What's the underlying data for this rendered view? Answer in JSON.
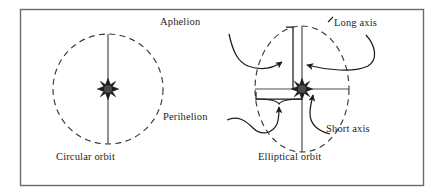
{
  "figure": {
    "kind": "diagram",
    "title_visible": false,
    "frame": {
      "name": "figure-border",
      "x": 20,
      "y": 9,
      "width": 404,
      "height": 177,
      "stroke": "#6b6b6b",
      "fill": "#ffffff"
    },
    "colors": {
      "ink": "#1d1d1d",
      "orbit_stroke": "#3a3a3a",
      "frame_stroke": "#6b6b6b",
      "axis_stroke": "#4a4a4a",
      "background": "#ffffff"
    }
  },
  "panels": [
    {
      "id": "circular",
      "caption": "Circular orbit",
      "caption_pos": {
        "x": 56,
        "y": 157
      },
      "orbit": {
        "type": "circle",
        "style": "dashed",
        "cx": 108,
        "cy": 89,
        "r": 55
      },
      "star": {
        "name": "sun-star",
        "cx": 108,
        "cy": 89,
        "r": 9
      },
      "axis": {
        "name": "vertical-diameter",
        "x1": 108,
        "y1": 34,
        "x2": 108,
        "y2": 144
      },
      "labels": [
        {
          "id": "aphelion",
          "text": "Aphelion",
          "x": 160,
          "y": 22
        },
        {
          "id": "perihelion",
          "text": "Perihelion",
          "x": 163,
          "y": 117
        }
      ]
    },
    {
      "id": "elliptical",
      "caption": "Elliptical orbit",
      "caption_pos": {
        "x": 258,
        "y": 157
      },
      "orbit": {
        "type": "ellipse",
        "style": "dashed",
        "cx": 302,
        "cy": 89,
        "rx": 47,
        "ry": 63
      },
      "star": {
        "name": "sun-star",
        "cx": 302,
        "cy": 89,
        "r": 9
      },
      "axes": [
        {
          "id": "long-axis-line",
          "name": "long-axis",
          "x1": 302,
          "y1": 26,
          "x2": 302,
          "y2": 152
        },
        {
          "id": "short-axis-line",
          "name": "short-axis",
          "x1": 255,
          "y1": 89,
          "x2": 349,
          "y2": 89
        }
      ],
      "labels": [
        {
          "id": "long-axis",
          "text": "Long axis",
          "x": 330,
          "y": 23
        },
        {
          "id": "short-axis",
          "text": "Short axis",
          "x": 326,
          "y": 121
        }
      ]
    }
  ],
  "annotations": {
    "leader_curves": 4,
    "arrowheads": 4,
    "brace_markers": 2
  }
}
